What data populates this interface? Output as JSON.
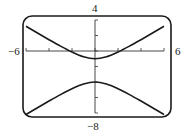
{
  "labels": {
    "xmin": "−6",
    "xmax": "6",
    "ymax": "4",
    "ymin": "−8"
  },
  "chart_data": {
    "type": "line",
    "title": "",
    "xlabel": "",
    "ylabel": "",
    "xlim": [
      -6,
      6
    ],
    "ylim": [
      -8,
      4
    ],
    "x_ticks_step": 2,
    "y_ticks_step": 2,
    "grid": false,
    "legend": null,
    "frame": "rounded-rectangle calculator screen",
    "x": [
      -6,
      -5,
      -4,
      -3,
      -2,
      -1,
      0,
      1,
      2,
      3,
      4,
      5,
      6
    ],
    "series": [
      {
        "name": "upper branch",
        "values": [
          3.2,
          2.32,
          1.46,
          0.63,
          -0.13,
          -0.74,
          -1.0,
          -0.74,
          -0.13,
          0.63,
          1.46,
          2.32,
          3.2
        ]
      },
      {
        "name": "lower branch",
        "values": [
          -8.2,
          -7.32,
          -6.46,
          -5.63,
          -4.87,
          -4.26,
          -4.0,
          -4.26,
          -4.87,
          -5.63,
          -6.46,
          -7.32,
          -8.2
        ]
      }
    ],
    "colors": {
      "curve": "#1a1a1a",
      "axis": "#333333",
      "frame": "#1a1a1a"
    }
  }
}
